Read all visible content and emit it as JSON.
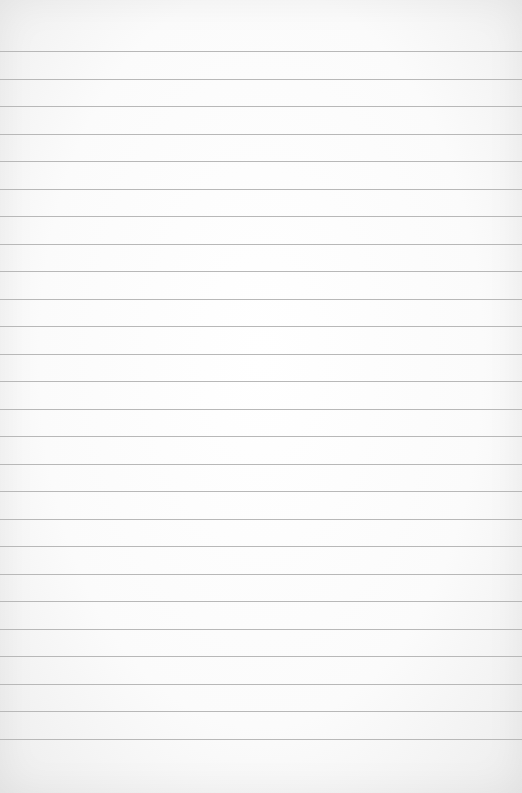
{
  "paper": {
    "kind": "lined-paper",
    "background": "#fdfdfd",
    "line_color": "#b8b8b8",
    "first_line_y": 51,
    "line_spacing": 27.5,
    "line_count": 26
  }
}
